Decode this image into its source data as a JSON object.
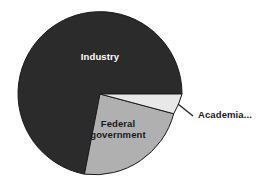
{
  "chart_data": {
    "type": "pie",
    "title": "",
    "subtitle": "",
    "xlabel": "",
    "ylabel": "",
    "legend_position": "none",
    "grid": false,
    "labels_inside": true,
    "categories": [
      "Industry",
      "Federal government",
      "Academia..."
    ],
    "values": [
      72,
      21,
      7
    ],
    "slices": [
      {
        "label": "Industry",
        "value": 72,
        "color": "#2b2b2b",
        "label_color": "#ffffff",
        "label_placement": "inside",
        "start_angle_deg": 0,
        "end_angle_deg": 259
      },
      {
        "label": "Federal government",
        "value": 21,
        "color": "#b0b0b0",
        "label_color": "#1a1a1a",
        "label_placement": "inside",
        "start_angle_deg": 259,
        "end_angle_deg": 334
      },
      {
        "label": "Academia...",
        "value": 7,
        "color": "#e8e8e8",
        "label_color": "#1a1a1a",
        "label_placement": "outside-leader",
        "start_angle_deg": 334,
        "end_angle_deg": 360
      }
    ],
    "outline_color": "#1a1a1a",
    "background": "#ffffff"
  },
  "pie": {
    "center_x": 100,
    "center_y": 94,
    "radius": 82,
    "industry_path": "M 182 94 A 82 82 0 1 0 84.44 174.16 L 100 94 Z",
    "federal_path": "M 84.44 174.16 A 82 82 0 0 0 173.72 113.74 L 100 94 Z",
    "academia_path": "M 173.72 113.74 A 82 82 0 0 0 182 94 L 100 94 Z",
    "leader_line": "M 178 104 L 193 116"
  },
  "labels": {
    "industry": "Industry",
    "federal_line1": "Federal",
    "federal_line2": "government",
    "academia": "Academia..."
  }
}
